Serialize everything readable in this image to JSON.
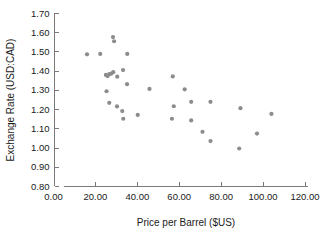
{
  "chart_data": {
    "type": "scatter",
    "title": "",
    "xlabel": "Price per Barrel ($US)",
    "ylabel": "Exchange Rate (USD:CAD)",
    "xlim": [
      0.0,
      120.0
    ],
    "ylim": [
      0.8,
      1.7
    ],
    "xticks": [
      0.0,
      20.0,
      40.0,
      60.0,
      80.0,
      100.0,
      120.0
    ],
    "yticks": [
      0.8,
      0.9,
      1.0,
      1.1,
      1.2,
      1.3,
      1.4,
      1.5,
      1.6,
      1.7
    ],
    "xtick_labels": [
      "0.00",
      "20.00",
      "40.00",
      "60.00",
      "80.00",
      "100.00",
      "120.00"
    ],
    "ytick_labels": [
      "0.80",
      "0.90",
      "1.00",
      "1.10",
      "1.20",
      "1.30",
      "1.40",
      "1.50",
      "1.60",
      "1.70"
    ],
    "grid": false,
    "legend": null,
    "marker_color": "#8c8c8c",
    "marker_size": 2.1,
    "axis_color": "#7a7a7a",
    "series": [
      {
        "name": "Price per Barrel vs Exchange Rate",
        "points": [
          [
            16.0,
            1.485
          ],
          [
            22.3,
            1.487
          ],
          [
            28.4,
            1.575
          ],
          [
            28.9,
            1.553
          ],
          [
            35.2,
            1.487
          ],
          [
            25.0,
            1.378
          ],
          [
            25.8,
            1.372
          ],
          [
            26.6,
            1.382
          ],
          [
            27.6,
            1.385
          ],
          [
            28.5,
            1.392
          ],
          [
            30.4,
            1.369
          ],
          [
            33.2,
            1.403
          ],
          [
            35.1,
            1.33
          ],
          [
            25.3,
            1.293
          ],
          [
            45.8,
            1.305
          ],
          [
            26.6,
            1.233
          ],
          [
            30.3,
            1.214
          ],
          [
            32.8,
            1.19
          ],
          [
            33.3,
            1.15
          ],
          [
            40.2,
            1.17
          ],
          [
            56.9,
            1.37
          ],
          [
            62.6,
            1.303
          ],
          [
            57.4,
            1.215
          ],
          [
            65.7,
            1.238
          ],
          [
            74.9,
            1.238
          ],
          [
            56.5,
            1.15
          ],
          [
            65.7,
            1.141
          ],
          [
            71.1,
            1.082
          ],
          [
            74.9,
            1.034
          ],
          [
            88.6,
            0.995
          ],
          [
            89.2,
            1.205
          ],
          [
            97.1,
            1.073
          ],
          [
            104.0,
            1.175
          ]
        ]
      }
    ]
  },
  "axes": {
    "y_axis_title": "Exchange Rate (USD:CAD)",
    "x_axis_title": "Price per Barrel ($US)"
  }
}
